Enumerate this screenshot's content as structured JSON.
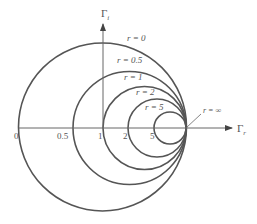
{
  "figure": {
    "stroke_color": "#555555",
    "axis_color": "#666666",
    "background": "#ffffff"
  },
  "axes": {
    "horizontal": {
      "label": "Γ",
      "subscript": "r",
      "x1": 19,
      "x2": 232,
      "y": 128,
      "label_x": 237,
      "label_y": 132
    },
    "vertical": {
      "label": "Γ",
      "subscript": "i",
      "x": 103,
      "y1": 128,
      "y2": 24,
      "label_x": 101,
      "label_y": 17
    }
  },
  "circles": [
    {
      "r_value": "0",
      "cx": 102.5,
      "cy": 127,
      "radius": 84,
      "label": "r = 0",
      "label_x": 127,
      "label_y": 41
    },
    {
      "r_value": "0.5",
      "cx": 129.5,
      "cy": 128,
      "radius": 56.5,
      "label": "r = 0.5",
      "label_x": 117,
      "label_y": 63
    },
    {
      "r_value": "1",
      "cx": 144.5,
      "cy": 128,
      "radius": 41.5,
      "label": "r = 1",
      "label_x": 124,
      "label_y": 80
    },
    {
      "r_value": "2",
      "cx": 157,
      "cy": 128,
      "radius": 29,
      "label": "r = 2",
      "label_x": 136,
      "label_y": 95
    },
    {
      "r_value": "5",
      "cx": 170,
      "cy": 128,
      "radius": 16,
      "label": "r = 5",
      "label_x": 145,
      "label_y": 110
    }
  ],
  "tick_labels": [
    {
      "text": "0",
      "x": 14,
      "y": 139
    },
    {
      "text": "0.5",
      "x": 57,
      "y": 139
    },
    {
      "text": "1",
      "x": 98,
      "y": 139
    },
    {
      "text": "2",
      "x": 123,
      "y": 139
    },
    {
      "text": "5",
      "x": 150,
      "y": 139
    }
  ],
  "infinity_marker": {
    "label": "r = ∞",
    "label_x": 203,
    "label_y": 113,
    "leader_x1": 186,
    "leader_y1": 128,
    "leader_x2": 201,
    "leader_y2": 114
  }
}
